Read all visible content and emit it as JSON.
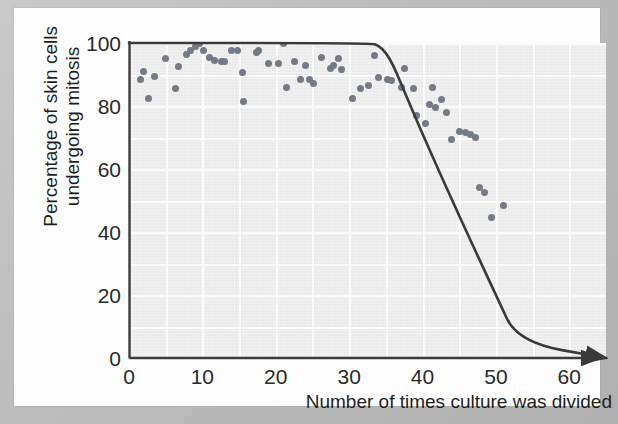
{
  "figure": {
    "background_color": "#bdbdbd",
    "page_color": "#fdfdfd",
    "plot_background_color": "#ebebeb",
    "axis_color": "#3a3a3a",
    "point_color": "#757b86",
    "curve_color": "#3a3a3a"
  },
  "chart_data": {
    "type": "scatter",
    "title": "",
    "subtitle": "",
    "xlabel": "Number of times culture was divided",
    "ylabel": "Percentage of skin cells\nundergoing mitosis",
    "xlim": [
      0,
      65
    ],
    "ylim": [
      0,
      100
    ],
    "xticks": [
      0,
      10,
      20,
      30,
      40,
      50,
      60
    ],
    "xtick_labels": [
      "0",
      "10",
      "20",
      "30",
      "40",
      "50",
      "60"
    ],
    "yticks": [
      0,
      20,
      40,
      60,
      80,
      100
    ],
    "ytick_labels": [
      "0",
      "20",
      "40",
      "60",
      "80",
      "100"
    ],
    "grid": true,
    "grid_x_step": 5,
    "grid_y_step": 10,
    "legend": "none",
    "x_axis_arrow": true,
    "annotations": [],
    "series": [
      {
        "name": "Percentage of skin cells undergoing mitosis",
        "type": "scatter",
        "marker": "circle",
        "color": "#757b86",
        "points": [
          [
            1.5,
            88.5
          ],
          [
            2.0,
            91.0
          ],
          [
            2.6,
            82.5
          ],
          [
            3.5,
            89.5
          ],
          [
            5.0,
            95.0
          ],
          [
            6.4,
            85.5
          ],
          [
            6.8,
            92.5
          ],
          [
            7.8,
            96.5
          ],
          [
            8.4,
            97.5
          ],
          [
            9.0,
            99.0
          ],
          [
            9.6,
            100.0
          ],
          [
            10.2,
            97.5
          ],
          [
            11.0,
            95.5
          ],
          [
            11.6,
            94.5
          ],
          [
            12.6,
            94.0
          ],
          [
            13.0,
            94.0
          ],
          [
            14.0,
            97.5
          ],
          [
            14.8,
            97.5
          ],
          [
            15.4,
            90.5
          ],
          [
            15.6,
            81.5
          ],
          [
            17.4,
            97.0
          ],
          [
            17.6,
            97.5
          ],
          [
            19.0,
            93.5
          ],
          [
            20.4,
            93.5
          ],
          [
            21.0,
            100.0
          ],
          [
            21.4,
            86.0
          ],
          [
            22.6,
            94.0
          ],
          [
            23.4,
            88.5
          ],
          [
            24.0,
            93.0
          ],
          [
            24.6,
            88.5
          ],
          [
            25.2,
            87.0
          ],
          [
            26.2,
            95.5
          ],
          [
            27.4,
            92.0
          ],
          [
            27.8,
            93.0
          ],
          [
            28.6,
            95.0
          ],
          [
            29.0,
            91.5
          ],
          [
            30.4,
            82.5
          ],
          [
            31.6,
            85.5
          ],
          [
            32.6,
            86.5
          ],
          [
            33.4,
            96.0
          ],
          [
            34.0,
            89.0
          ],
          [
            35.2,
            88.5
          ],
          [
            35.8,
            88.0
          ],
          [
            37.2,
            86.0
          ],
          [
            37.6,
            92.0
          ],
          [
            38.8,
            85.5
          ],
          [
            39.2,
            77.0
          ],
          [
            40.4,
            74.5
          ],
          [
            41.0,
            80.5
          ],
          [
            41.4,
            86.0
          ],
          [
            41.8,
            79.5
          ],
          [
            42.6,
            82.0
          ],
          [
            43.2,
            78.0
          ],
          [
            44.0,
            69.5
          ],
          [
            45.0,
            72.0
          ],
          [
            45.8,
            71.5
          ],
          [
            46.6,
            71.0
          ],
          [
            47.2,
            70.0
          ],
          [
            47.8,
            54.0
          ],
          [
            48.4,
            52.5
          ],
          [
            49.4,
            44.5
          ],
          [
            51.0,
            48.5
          ]
        ]
      },
      {
        "name": "Trend curve",
        "type": "line",
        "color": "#3a3a3a",
        "points": [
          [
            0,
            100
          ],
          [
            33,
            100
          ],
          [
            34,
            99.2
          ],
          [
            35,
            97.0
          ],
          [
            36,
            93.0
          ],
          [
            37,
            87.5
          ],
          [
            40,
            71.0
          ],
          [
            45,
            45.0
          ],
          [
            50,
            20.0
          ],
          [
            53,
            5.0
          ],
          [
            65,
            0
          ]
        ]
      }
    ]
  }
}
